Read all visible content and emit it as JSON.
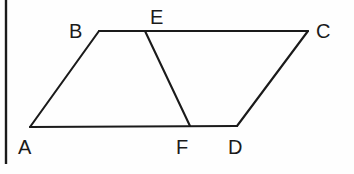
{
  "figure": {
    "background_color": "#fefefe",
    "stroke_color": "#1a1a1a",
    "width": 354,
    "height": 174,
    "border": {
      "name": "left-page-border",
      "x1": 6,
      "y1": 0,
      "x2": 6,
      "y2": 164
    },
    "vertices": [
      {
        "id": "A",
        "label": "A",
        "x": 30,
        "y": 127,
        "label_x": 18,
        "label_y": 154
      },
      {
        "id": "B",
        "label": "B",
        "x": 99,
        "y": 31,
        "label_x": 69,
        "label_y": 38
      },
      {
        "id": "C",
        "label": "C",
        "x": 308,
        "y": 31,
        "label_x": 316,
        "label_y": 38
      },
      {
        "id": "D",
        "label": "D",
        "x": 237,
        "y": 126,
        "label_x": 228,
        "label_y": 154
      },
      {
        "id": "E",
        "label": "E",
        "x": 145,
        "y": 31,
        "label_x": 150,
        "label_y": 24
      },
      {
        "id": "F",
        "label": "F",
        "x": 190,
        "y": 126,
        "label_x": 176,
        "label_y": 154
      }
    ],
    "segments": [
      {
        "name": "segment-AB",
        "from": "A",
        "to": "B",
        "x1": 30,
        "y1": 127,
        "x2": 99,
        "y2": 31
      },
      {
        "name": "segment-BC",
        "from": "B",
        "to": "C",
        "x1": 99,
        "y1": 31,
        "x2": 308,
        "y2": 31
      },
      {
        "name": "segment-CD",
        "from": "C",
        "to": "D",
        "x1": 308,
        "y1": 31,
        "x2": 237,
        "y2": 126
      },
      {
        "name": "segment-AD",
        "from": "A",
        "to": "D",
        "x1": 30,
        "y1": 127,
        "x2": 237,
        "y2": 126
      },
      {
        "name": "segment-EF",
        "from": "E",
        "to": "F",
        "x1": 145,
        "y1": 31,
        "x2": 190,
        "y2": 126
      }
    ]
  }
}
